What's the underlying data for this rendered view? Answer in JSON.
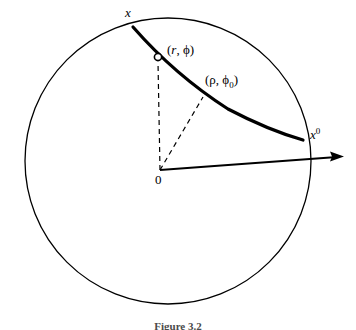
{
  "figure": {
    "domain": "diagram",
    "background_color": "#ffffff",
    "stroke_color": "#000000",
    "caption": "Figure 3.2",
    "labels": {
      "boundary_point_x": "x",
      "interior_point": "(r, ϕ)",
      "interior_point_r": "r",
      "interior_point_phi": "ϕ",
      "curve_point": "(ρ, ϕ",
      "curve_point_subscript": "0",
      "curve_point_close": ")",
      "reference_direction": "x",
      "reference_direction_sup": "0",
      "origin": "0"
    },
    "geometry": {
      "circle": {
        "cx": 168,
        "cy": 161,
        "r": 143
      },
      "origin": {
        "x": 160,
        "y": 170
      },
      "point_x": {
        "x": 133,
        "y": 27
      },
      "point_marker": {
        "x": 158,
        "y": 57
      },
      "point_rho": {
        "x": 203,
        "y": 97
      },
      "point_x0": {
        "x": 303,
        "y": 140
      },
      "arrow_tip": {
        "x": 344,
        "y": 157
      }
    }
  }
}
